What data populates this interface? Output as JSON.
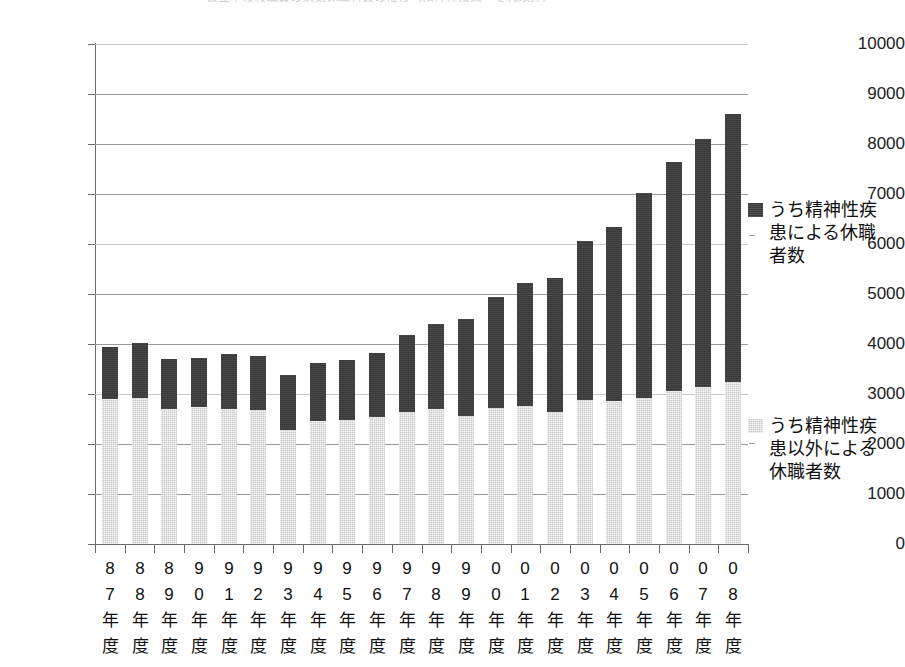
{
  "chart_data": {
    "type": "bar",
    "subtype": "stacked-vertical",
    "title": "公立学校教職員の病気休職者数の推移（精神性疾患・それ以外）",
    "xlabel": "",
    "ylabel": "",
    "ylim": [
      0,
      10000
    ],
    "ytick_step": 1000,
    "ytick_labels": [
      "10000",
      "9000",
      "8000",
      "7000",
      "6000",
      "5000",
      "4000",
      "3000",
      "2000",
      "1000",
      "0"
    ],
    "grid": true,
    "legend_position": "right",
    "categories": [
      "87年度",
      "88年度",
      "89年度",
      "90年度",
      "91年度",
      "92年度",
      "93年度",
      "94年度",
      "95年度",
      "96年度",
      "97年度",
      "98年度",
      "99年度",
      "00年度",
      "01年度",
      "02年度",
      "03年度",
      "04年度",
      "05年度",
      "06年度",
      "07年度",
      "08年度"
    ],
    "series": [
      {
        "name": "うち精神性疾患以外による休職者数",
        "color": "#c8c8c8",
        "values": [
          2890,
          2920,
          2690,
          2740,
          2700,
          2670,
          2280,
          2450,
          2480,
          2530,
          2630,
          2700,
          2560,
          2710,
          2760,
          2630,
          2880,
          2860,
          2910,
          3060,
          3130,
          3240
        ]
      },
      {
        "name": "うち精神性疾患による休職者数",
        "color": "#3a3a3a",
        "values": [
          1030,
          1090,
          990,
          970,
          1100,
          1080,
          1100,
          1160,
          1190,
          1280,
          1540,
          1690,
          1930,
          2220,
          2460,
          2680,
          3180,
          3480,
          4100,
          4580,
          4950,
          5360
        ]
      }
    ],
    "totals": [
      3920,
      4010,
      3680,
      3710,
      3800,
      3750,
      3380,
      3610,
      3670,
      3810,
      4170,
      4390,
      4490,
      4930,
      5220,
      5310,
      6060,
      6340,
      7010,
      7640,
      8080,
      8600
    ]
  },
  "legend": {
    "entries": [
      {
        "label": "うち精神性疾患による休職者数",
        "swatch": "mental"
      },
      {
        "label": "うち精神性疾患以外による休職者数",
        "swatch": "other"
      }
    ]
  }
}
